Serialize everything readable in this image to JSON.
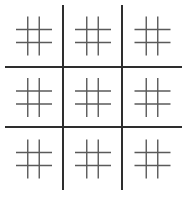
{
  "game": {
    "type": "ultimate-tic-tac-toe",
    "board_size": 3,
    "sub_board_size": 3,
    "state": "empty"
  },
  "colors": {
    "background": "#ffffff",
    "main_grid": "#2e2e2e",
    "sub_grid": "#5a5a5a"
  },
  "layout": {
    "main_vertical_x": [
      63,
      122
    ],
    "main_vertical_y": [
      5,
      190
    ],
    "main_horizontal_y": [
      67,
      127
    ],
    "main_horizontal_x": [
      5,
      182
    ],
    "cells": [
      {
        "row": 0,
        "col": 0,
        "x": 5,
        "y": 5,
        "w": 58,
        "h": 62
      },
      {
        "row": 0,
        "col": 1,
        "x": 64,
        "y": 5,
        "w": 58,
        "h": 62
      },
      {
        "row": 0,
        "col": 2,
        "x": 123,
        "y": 5,
        "w": 59,
        "h": 62
      },
      {
        "row": 1,
        "col": 0,
        "x": 5,
        "y": 68,
        "w": 58,
        "h": 59
      },
      {
        "row": 1,
        "col": 1,
        "x": 64,
        "y": 68,
        "w": 58,
        "h": 59
      },
      {
        "row": 1,
        "col": 2,
        "x": 123,
        "y": 68,
        "w": 59,
        "h": 59
      },
      {
        "row": 2,
        "col": 0,
        "x": 5,
        "y": 128,
        "w": 58,
        "h": 62
      },
      {
        "row": 2,
        "col": 1,
        "x": 64,
        "y": 128,
        "w": 58,
        "h": 62
      },
      {
        "row": 2,
        "col": 2,
        "x": 123,
        "y": 128,
        "w": 59,
        "h": 62
      }
    ]
  },
  "sub_boards": [
    {
      "id": "top-left",
      "marks": [
        "",
        "",
        "",
        "",
        "",
        "",
        "",
        "",
        ""
      ]
    },
    {
      "id": "top-center",
      "marks": [
        "",
        "",
        "",
        "",
        "",
        "",
        "",
        "",
        ""
      ]
    },
    {
      "id": "top-right",
      "marks": [
        "",
        "",
        "",
        "",
        "",
        "",
        "",
        "",
        ""
      ]
    },
    {
      "id": "middle-left",
      "marks": [
        "",
        "",
        "",
        "",
        "",
        "",
        "",
        "",
        ""
      ]
    },
    {
      "id": "center",
      "marks": [
        "",
        "",
        "",
        "",
        "",
        "",
        "",
        "",
        ""
      ]
    },
    {
      "id": "middle-right",
      "marks": [
        "",
        "",
        "",
        "",
        "",
        "",
        "",
        "",
        ""
      ]
    },
    {
      "id": "bottom-left",
      "marks": [
        "",
        "",
        "",
        "",
        "",
        "",
        "",
        "",
        ""
      ]
    },
    {
      "id": "bottom-center",
      "marks": [
        "",
        "",
        "",
        "",
        "",
        "",
        "",
        "",
        ""
      ]
    },
    {
      "id": "bottom-right",
      "marks": [
        "",
        "",
        "",
        "",
        "",
        "",
        "",
        "",
        ""
      ]
    }
  ]
}
